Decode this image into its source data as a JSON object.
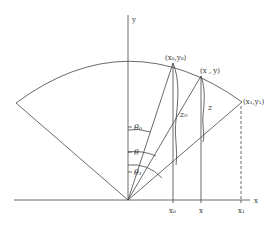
{
  "diagram": {
    "stroke_color": "#444444",
    "axes": {
      "x_label": "x",
      "y_label": "y"
    },
    "points": {
      "p0": "(x₀,y₀)",
      "p": "(x , y)",
      "p1": "(x₁,y₁)"
    },
    "angles": {
      "theta0": "θ₀",
      "theta": "θ",
      "theta1": "θ₁"
    },
    "heights": {
      "z0": "z₀",
      "z": "z"
    },
    "x_ticks": {
      "x0": "x₀",
      "x": "x",
      "x1": "x₁"
    }
  }
}
